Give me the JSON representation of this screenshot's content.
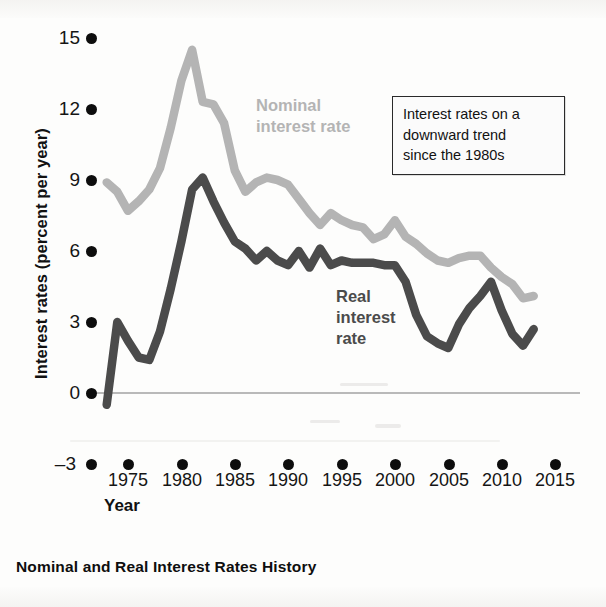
{
  "caption": "Nominal and Real Interest Rates History",
  "annotation": {
    "line1": "Interest rates on a",
    "line2": "downward trend",
    "line3": "since the 1980s"
  },
  "series_labels": {
    "nominal_line1": "Nominal",
    "nominal_line2": "interest rate",
    "real_line1": "Real",
    "real_line2": "interest",
    "real_line3": "rate"
  },
  "colors": {
    "nominal": "#b4b4b4",
    "real": "#4b4b4b",
    "axis": "#0d0d0d",
    "zero_line": "#b9b9b9",
    "annotation_border": "#2a2a2a"
  },
  "chart_data": {
    "type": "line",
    "title": "Nominal and Real Interest Rates History",
    "xlabel": "Year",
    "ylabel": "Interest rates (percent per year)",
    "xlim": [
      1972,
      2016
    ],
    "ylim": [
      -3,
      15
    ],
    "xticks": [
      1975,
      1980,
      1985,
      1990,
      1995,
      2000,
      2005,
      2010,
      2015
    ],
    "yticks": [
      -3,
      0,
      3,
      6,
      9,
      12,
      15
    ],
    "grid": false,
    "legend": "inline-annotation",
    "annotations": [
      {
        "text": "Interest rates on a downward trend since the 1980s",
        "x": 2003,
        "y": 12.5
      }
    ],
    "series": [
      {
        "name": "Nominal interest rate",
        "color": "#b4b4b4",
        "x": [
          1973,
          1974,
          1975,
          1976,
          1977,
          1978,
          1979,
          1980,
          1981,
          1982,
          1983,
          1984,
          1985,
          1986,
          1987,
          1988,
          1989,
          1990,
          1991,
          1992,
          1993,
          1994,
          1995,
          1996,
          1997,
          1998,
          1999,
          2000,
          2001,
          2002,
          2003,
          2004,
          2005,
          2006,
          2007,
          2008,
          2009,
          2010,
          2011,
          2012,
          2013
        ],
        "values": [
          8.9,
          8.5,
          7.7,
          8.1,
          8.6,
          9.5,
          11.2,
          13.2,
          14.5,
          12.3,
          12.2,
          11.4,
          9.4,
          8.5,
          8.9,
          9.1,
          9.0,
          8.8,
          8.2,
          7.6,
          7.1,
          7.6,
          7.3,
          7.1,
          7.0,
          6.5,
          6.7,
          7.3,
          6.6,
          6.3,
          5.9,
          5.6,
          5.5,
          5.7,
          5.8,
          5.8,
          5.3,
          4.9,
          4.6,
          4.0,
          4.1
        ]
      },
      {
        "name": "Real interest rate",
        "color": "#4b4b4b",
        "x": [
          1973,
          1974,
          1975,
          1976,
          1977,
          1978,
          1979,
          1980,
          1981,
          1982,
          1983,
          1984,
          1985,
          1986,
          1987,
          1988,
          1989,
          1990,
          1991,
          1992,
          1993,
          1994,
          1995,
          1996,
          1997,
          1998,
          1999,
          2000,
          2001,
          2002,
          2003,
          2004,
          2005,
          2006,
          2007,
          2008,
          2009,
          2010,
          2011,
          2012,
          2013
        ],
        "values": [
          -0.5,
          3.0,
          2.2,
          1.5,
          1.4,
          2.6,
          4.4,
          6.4,
          8.6,
          9.1,
          8.1,
          7.2,
          6.4,
          6.1,
          5.6,
          6.0,
          5.6,
          5.4,
          6.0,
          5.3,
          6.1,
          5.4,
          5.6,
          5.5,
          5.5,
          5.5,
          5.4,
          5.4,
          4.7,
          3.3,
          2.4,
          2.1,
          1.9,
          2.9,
          3.6,
          4.1,
          4.7,
          3.5,
          2.5,
          2.0,
          2.7
        ]
      }
    ]
  },
  "yaxis": {
    "label": "Interest rates (percent per year)",
    "ticks": [
      "15",
      "12",
      "9",
      "6",
      "3",
      "0",
      "–3"
    ]
  },
  "xaxis": {
    "label": "Year",
    "ticks": [
      "1975",
      "1980",
      "1985",
      "1990",
      "1995",
      "2000",
      "2005",
      "2010",
      "2015"
    ]
  }
}
